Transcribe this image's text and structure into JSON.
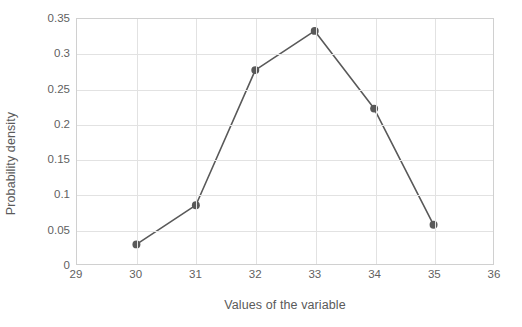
{
  "chart_data": {
    "type": "line",
    "title": "",
    "xlabel": "Values of the variable",
    "ylabel": "Probability density",
    "x": [
      30,
      31,
      32,
      33,
      34,
      35
    ],
    "values": [
      0.028,
      0.084,
      0.277,
      0.333,
      0.222,
      0.056
    ],
    "series": [
      {
        "name": "Probability density",
        "values": [
          0.028,
          0.084,
          0.277,
          0.333,
          0.222,
          0.056
        ]
      }
    ],
    "xlim": [
      29,
      36
    ],
    "ylim": [
      0,
      0.35
    ],
    "xticks": [
      "29",
      "30",
      "31",
      "32",
      "33",
      "34",
      "35",
      "36"
    ],
    "yticks": [
      "0",
      "0.05",
      "0.1",
      "0.15",
      "0.2",
      "0.25",
      "0.3",
      "0.35"
    ],
    "xtick_values": [
      29,
      30,
      31,
      32,
      33,
      34,
      35,
      36
    ],
    "ytick_values": [
      0,
      0.05,
      0.1,
      0.15,
      0.2,
      0.25,
      0.3,
      0.35
    ],
    "grid": "both",
    "legend": "none",
    "line_color": "#595959",
    "marker_color": "#595959",
    "gridline_color": "#e2e2e2",
    "plot_border_color": "#d0d0d0",
    "marker": "circle"
  }
}
